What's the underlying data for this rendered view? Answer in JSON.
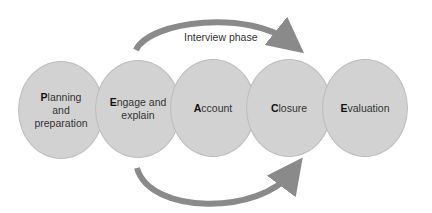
{
  "diagram": {
    "top_arrow_label": "Interview phase",
    "colors": {
      "node_fill": "#d2d2d2",
      "arrow": "#8a8a8a",
      "text": "#333333"
    },
    "nodes": [
      {
        "initial": "P",
        "rest_line1": "lanning",
        "line2": "and",
        "line3": "preparation"
      },
      {
        "initial": "E",
        "rest_line1": "ngage and",
        "line2": "explain",
        "line3": ""
      },
      {
        "initial": "A",
        "rest_line1": "ccount",
        "line2": "",
        "line3": ""
      },
      {
        "initial": "C",
        "rest_line1": "losure",
        "line2": "",
        "line3": ""
      },
      {
        "initial": "E",
        "rest_line1": "valuation",
        "line2": "",
        "line3": ""
      }
    ]
  }
}
